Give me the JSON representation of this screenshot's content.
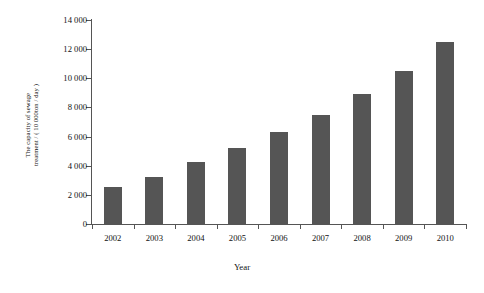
{
  "chart_data": {
    "type": "bar",
    "title": "",
    "xlabel": "Year",
    "ylabel": "The capacity of sewage treatment / ( 10 000ton / day )",
    "ylabel_lines": [
      "The capacity of sewage",
      "treatment / ( 10 000ton / day )"
    ],
    "categories": [
      "2002",
      "2003",
      "2004",
      "2005",
      "2006",
      "2007",
      "2008",
      "2009",
      "2010"
    ],
    "values": [
      2550,
      3250,
      4250,
      5200,
      6300,
      7500,
      8900,
      10500,
      12500
    ],
    "ylim": [
      0,
      14000
    ],
    "ytick_values": [
      0,
      2000,
      4000,
      6000,
      8000,
      10000,
      12000,
      14000
    ],
    "ytick_labels": [
      "0",
      "2 000",
      "4 000",
      "6 000",
      "8 000",
      "10 000",
      "12 000",
      "14 000"
    ],
    "grid": false,
    "legend": null,
    "bar_color": "#555555",
    "axis_color": "#555555",
    "text_color": "#111111"
  }
}
